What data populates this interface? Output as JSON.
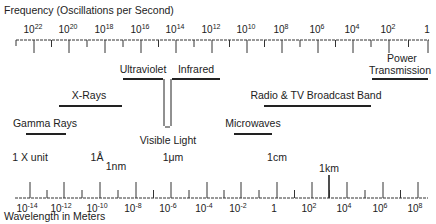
{
  "frequency_axis": {
    "title": "Frequency (Oscillations per Second)",
    "ticks": [
      {
        "base": "10",
        "exp": "22",
        "x": 34
      },
      {
        "base": "10",
        "exp": "20",
        "x": 69
      },
      {
        "base": "10",
        "exp": "18",
        "x": 105
      },
      {
        "base": "10",
        "exp": "16",
        "x": 141
      },
      {
        "base": "10",
        "exp": "14",
        "x": 176
      },
      {
        "base": "10",
        "exp": "12",
        "x": 212
      },
      {
        "base": "10",
        "exp": "10",
        "x": 247
      },
      {
        "base": "10",
        "exp": "8",
        "x": 282
      },
      {
        "base": "10",
        "exp": "6",
        "x": 318
      },
      {
        "base": "10",
        "exp": "4",
        "x": 353
      },
      {
        "base": "10",
        "exp": "2",
        "x": 389
      },
      {
        "base": "1",
        "exp": "",
        "x": 428
      }
    ]
  },
  "bands": [
    {
      "name": "Ultraviolet",
      "x1": 123,
      "x2": 163,
      "y": 79,
      "label_x": 143,
      "label_y": 73
    },
    {
      "name": "Infrared",
      "x1": 172,
      "x2": 220,
      "y": 79,
      "label_x": 196,
      "label_y": 73
    },
    {
      "name": "X-Rays",
      "x1": 59,
      "x2": 122,
      "y": 106,
      "label_x": 89,
      "label_y": 99
    },
    {
      "name": "Radio & TV Broadcast Band",
      "x1": 264,
      "x2": 371,
      "y": 106,
      "label_x": 316,
      "label_y": 99
    },
    {
      "name": "Gamma Rays",
      "x1": 26,
      "x2": 66,
      "y": 134,
      "label_x": 45,
      "label_y": 127
    },
    {
      "name": "Microwaves",
      "x1": 234,
      "x2": 272,
      "y": 134,
      "label_x": 253,
      "label_y": 127
    },
    {
      "name": "Power",
      "name2": "Transmission",
      "x1": 372,
      "x2": 428,
      "y": 79,
      "label_x": 402,
      "label_y": 62
    }
  ],
  "visible_light": {
    "label": "Visible Light",
    "x1": 164,
    "x2": 171,
    "top": 79,
    "bottom": 126,
    "label_x": 168,
    "label_y": 144
  },
  "unit_markers": [
    {
      "label": "1 X unit",
      "x": 30,
      "y": 161
    },
    {
      "label": "1Å",
      "x": 97,
      "y": 161
    },
    {
      "label": "1nm",
      "x": 116,
      "y": 170
    },
    {
      "label": "1μm",
      "x": 173,
      "y": 161
    },
    {
      "label": "1cm",
      "x": 277,
      "y": 161
    },
    {
      "label": "1km",
      "x": 329,
      "y": 172
    }
  ],
  "wavelength_axis": {
    "title": "Wavelength in Meters",
    "ticks": [
      {
        "base": "10",
        "exp": "-14",
        "x": 30
      },
      {
        "base": "10",
        "exp": "-12",
        "x": 64
      },
      {
        "base": "10",
        "exp": "-10",
        "x": 100
      },
      {
        "base": "10",
        "exp": "-8",
        "x": 136
      },
      {
        "base": "10",
        "exp": "-6",
        "x": 171
      },
      {
        "base": "10",
        "exp": "-4",
        "x": 207
      },
      {
        "base": "10",
        "exp": "-2",
        "x": 241
      },
      {
        "base": "1",
        "exp": "",
        "x": 277
      },
      {
        "base": "10",
        "exp": "2",
        "x": 312
      },
      {
        "base": "10",
        "exp": "4",
        "x": 347
      },
      {
        "base": "10",
        "exp": "6",
        "x": 383
      },
      {
        "base": "10",
        "exp": "8",
        "x": 418
      }
    ]
  }
}
